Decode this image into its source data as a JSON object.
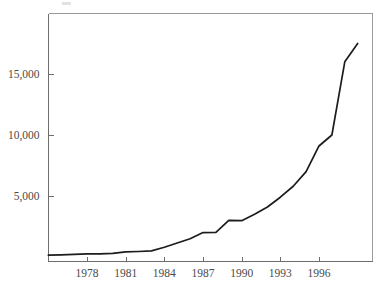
{
  "chart_data": {
    "type": "line",
    "title": "",
    "subtitle": "",
    "xlabel": "",
    "ylabel": "",
    "xlim": [
      1975,
      1999
    ],
    "ylim": [
      0,
      19500
    ],
    "grid": false,
    "legend": null,
    "x_tick_labels": [
      "1978",
      "1981",
      "1984",
      "1987",
      "1990",
      "1993",
      "1996"
    ],
    "x_ticks": [
      1978,
      1981,
      1984,
      1987,
      1990,
      1993,
      1996
    ],
    "y_tick_labels": [
      "5,000",
      "10,000",
      "15,000"
    ],
    "y_ticks": [
      5000,
      10000,
      15000
    ],
    "series": [
      {
        "name": "value",
        "color": "#1c1c1c",
        "x": [
          1975,
          1976,
          1977,
          1978,
          1979,
          1980,
          1981,
          1982,
          1983,
          1984,
          1985,
          1986,
          1987,
          1988,
          1989,
          1990,
          1991,
          1992,
          1993,
          1994,
          1995,
          1996,
          1997,
          1998,
          1999
        ],
        "values": [
          150,
          180,
          220,
          250,
          250,
          300,
          420,
          450,
          500,
          800,
          1150,
          1500,
          2000,
          2020,
          3000,
          2980,
          3500,
          4100,
          4900,
          5800,
          7000,
          9100,
          10000,
          16000,
          17500
        ]
      }
    ]
  },
  "axes": {
    "x_axis_name": "year-axis",
    "y_axis_name": "value-axis"
  }
}
